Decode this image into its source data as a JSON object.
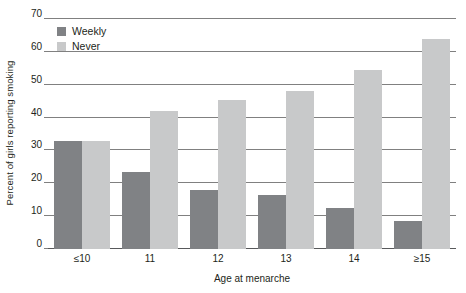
{
  "chart_data": {
    "type": "bar",
    "title": "",
    "xlabel": "Age at menarche",
    "ylabel": "Percent of girls reporting smoking",
    "categories": [
      "≤10",
      "11",
      "12",
      "13",
      "14",
      "≥15"
    ],
    "series": [
      {
        "name": "Weekly",
        "color": "#808285",
        "values": [
          33,
          23.5,
          18,
          16.5,
          12.5,
          8.5
        ]
      },
      {
        "name": "Never",
        "color": "#c8c9ca",
        "values": [
          33,
          42,
          45.5,
          48,
          54.5,
          64
        ]
      }
    ],
    "ylim": [
      0,
      70
    ],
    "yticks": [
      0,
      10,
      20,
      30,
      40,
      50,
      60,
      70
    ],
    "ytick_labels": [
      "0",
      "10",
      "20",
      "30",
      "40",
      "50",
      "60",
      "70"
    ],
    "grid": true,
    "legend_position": "top-left",
    "legend": [
      "Weekly",
      "Never"
    ]
  }
}
